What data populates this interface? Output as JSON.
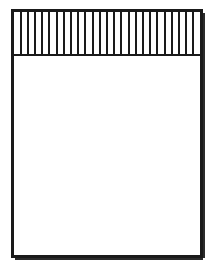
{
  "figure": {
    "kind": "line-drawing",
    "description": "Vertical rectangle outline with a hatched band of evenly spaced vertical lines across the upper portion and an empty white body below",
    "canvas": {
      "width": 216,
      "height": 267,
      "background_color": "#ffffff"
    },
    "colors": {
      "stroke": "#1a1a1a",
      "fill": "#ffffff",
      "shadow": "#2b2b2b"
    },
    "outer_rect": {
      "x": 12.5,
      "y": 10.5,
      "width": 189,
      "height": 246,
      "stroke_width": 2.2
    },
    "shadow_edge": {
      "right_x": 203.2,
      "bottom_y": 258.2,
      "stroke_width": 2.6
    },
    "hatch_band": {
      "top_y": 11.5,
      "bottom_y": 54.5,
      "left_x": 13.5,
      "right_x": 200.5,
      "line_count": 26,
      "spacing": 7.2,
      "line_stroke_width": 2.0
    },
    "divider": {
      "y": 55.0,
      "x1": 12.5,
      "x2": 201.5,
      "stroke_width": 2.2
    }
  },
  "chart_data": {
    "type": "table",
    "title": "",
    "xlabel": "",
    "ylabel": "",
    "categories": [],
    "values": []
  }
}
